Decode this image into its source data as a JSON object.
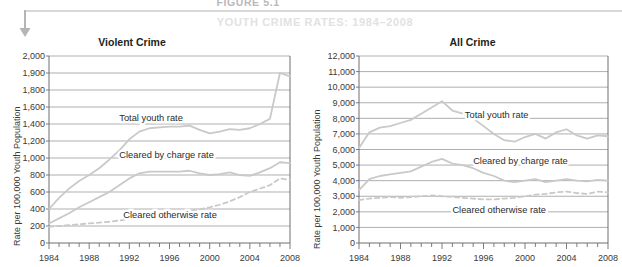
{
  "figure": {
    "number": "FIGURE 5.1",
    "title": "YOUTH CRIME RATES: 1984–2008",
    "arrow_icon": "down-arrow-icon"
  },
  "colors": {
    "line": "#c9c9c9",
    "grid": "#8c8c8c",
    "axis": "#6e6e6e",
    "text": "#231f20",
    "title_wash": "#e2e2e2",
    "rule": "#d8d8d8"
  },
  "chart_data": [
    {
      "type": "line",
      "title": "Violent Crime",
      "xlabel": "",
      "ylabel": "Rate per 100,000 Youth Population",
      "xlim": [
        1984,
        2008
      ],
      "ylim": [
        0,
        2000
      ],
      "grid": true,
      "legend_position": "inline-annotation",
      "xtick_labels": [
        "1984",
        "1988",
        "1992",
        "1996",
        "2000",
        "2004",
        "2008"
      ],
      "xticks": [
        1984,
        1988,
        1992,
        1996,
        2000,
        2004,
        2008
      ],
      "ytick_labels": [
        "0",
        "200",
        "400",
        "600",
        "800",
        "1,000",
        "1,200",
        "1,400",
        "1,600",
        "1,800",
        "1,900",
        "2,000"
      ],
      "yticks": [
        0,
        200,
        400,
        600,
        800,
        1000,
        1200,
        1400,
        1600,
        1800,
        1900,
        2000
      ],
      "x": [
        1984,
        1985,
        1986,
        1987,
        1988,
        1989,
        1990,
        1991,
        1992,
        1993,
        1994,
        1995,
        1996,
        1997,
        1998,
        1999,
        2000,
        2001,
        2002,
        2003,
        2004,
        2005,
        2006,
        2007,
        2008
      ],
      "series": [
        {
          "name": "Total youth rate",
          "style": "solid",
          "annotation": "Total youth rate",
          "values": [
            400,
            530,
            640,
            730,
            800,
            880,
            980,
            1090,
            1220,
            1310,
            1350,
            1360,
            1370,
            1370,
            1380,
            1330,
            1290,
            1310,
            1340,
            1330,
            1350,
            1400,
            1460,
            1900,
            1880
          ]
        },
        {
          "name": "Cleared by charge rate",
          "style": "solid",
          "annotation": "Cleared by charge rate",
          "values": [
            230,
            290,
            350,
            420,
            480,
            540,
            600,
            680,
            760,
            820,
            840,
            840,
            840,
            840,
            850,
            820,
            800,
            810,
            830,
            800,
            790,
            830,
            880,
            950,
            940
          ]
        },
        {
          "name": "Cleared otherwise rate",
          "style": "dashed",
          "annotation": "Cleared otherwise rate",
          "values": [
            190,
            200,
            210,
            220,
            230,
            240,
            250,
            265,
            280,
            295,
            310,
            325,
            340,
            355,
            375,
            395,
            420,
            450,
            490,
            540,
            600,
            640,
            680,
            760,
            740
          ]
        }
      ]
    },
    {
      "type": "line",
      "title": "All Crime",
      "xlabel": "",
      "ylabel": "Rate per 100,000 Youth Population",
      "xlim": [
        1984,
        2008
      ],
      "ylim": [
        0,
        12000
      ],
      "grid": true,
      "legend_position": "inline-annotation",
      "xtick_labels": [
        "1984",
        "1988",
        "1992",
        "1996",
        "2000",
        "2004",
        "2008"
      ],
      "xticks": [
        1984,
        1988,
        1992,
        1996,
        2000,
        2004,
        2008
      ],
      "ytick_labels": [
        "0",
        "1,000",
        "2,000",
        "3,000",
        "4,000",
        "5,000",
        "6,000",
        "7,000",
        "8,000",
        "9,000",
        "10,000",
        "11,000",
        "12,000"
      ],
      "yticks": [
        0,
        1000,
        2000,
        3000,
        4000,
        5000,
        6000,
        7000,
        8000,
        9000,
        10000,
        11000,
        12000
      ],
      "x": [
        1984,
        1985,
        1986,
        1987,
        1988,
        1989,
        1990,
        1991,
        1992,
        1993,
        1994,
        1995,
        1996,
        1997,
        1998,
        1999,
        2000,
        2001,
        2002,
        2003,
        2004,
        2005,
        2006,
        2007,
        2008
      ],
      "series": [
        {
          "name": "Total youth rate",
          "style": "solid",
          "annotation": "Total youth rate",
          "values": [
            6100,
            7100,
            7400,
            7500,
            7700,
            7900,
            8300,
            8700,
            9100,
            8500,
            8300,
            8000,
            7500,
            7000,
            6600,
            6500,
            6800,
            7000,
            6700,
            7100,
            7300,
            6900,
            6700,
            6900,
            6850
          ]
        },
        {
          "name": "Cleared by charge rate",
          "style": "solid",
          "annotation": "Cleared by charge rate",
          "values": [
            3400,
            4100,
            4300,
            4400,
            4500,
            4600,
            4900,
            5200,
            5400,
            5100,
            5000,
            4800,
            4500,
            4300,
            4000,
            3900,
            4000,
            4100,
            3900,
            4000,
            4100,
            4000,
            3950,
            4050,
            4000
          ]
        },
        {
          "name": "Cleared otherwise rate",
          "style": "dashed",
          "annotation": "Cleared otherwise rate",
          "values": [
            2750,
            2850,
            2900,
            2950,
            2900,
            2950,
            3000,
            3050,
            3000,
            2950,
            2900,
            2850,
            2800,
            2800,
            2850,
            2900,
            3000,
            3100,
            3150,
            3250,
            3300,
            3200,
            3150,
            3300,
            3250
          ]
        }
      ]
    }
  ]
}
